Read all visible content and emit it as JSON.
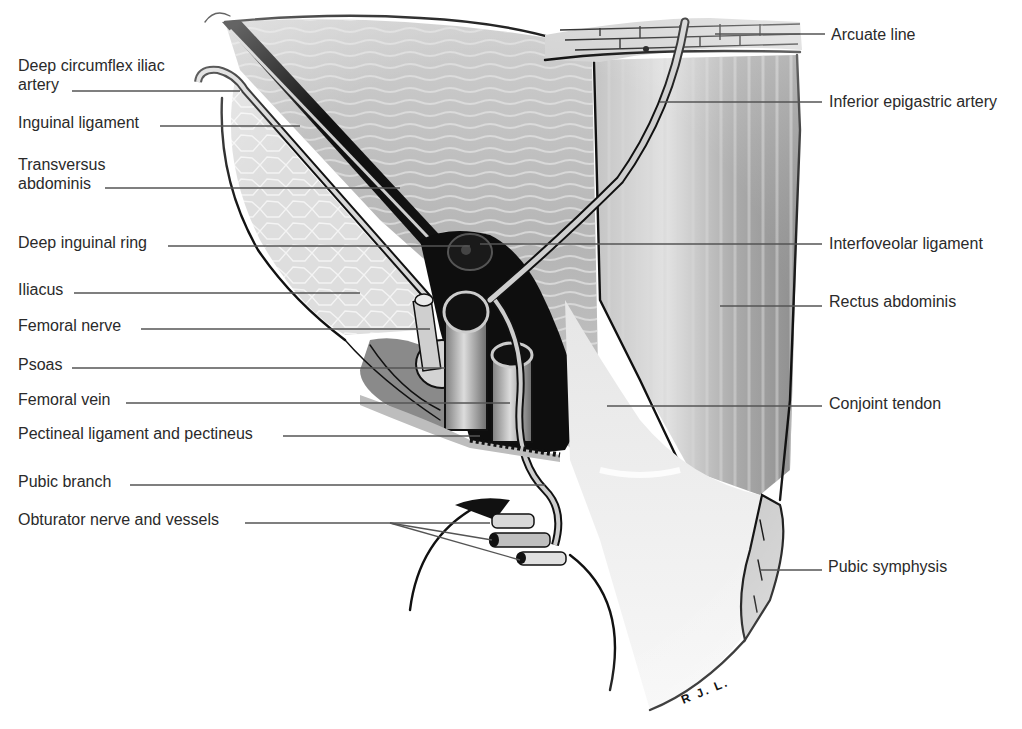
{
  "figure": {
    "signature": "R J. L.",
    "colors": {
      "background": "#ffffff",
      "muscle_light": "#d9d9d9",
      "muscle_mid": "#a8a8a8",
      "muscle_dark": "#7a7a7a",
      "outline": "#111111",
      "label_text": "#2a2a2a",
      "leader_line": "#555555"
    }
  },
  "labels_left": [
    {
      "id": "deep-circumflex-iliac-artery",
      "text": "Deep circumflex iliac\nartery",
      "line1": "Deep circumflex iliac",
      "line2": "artery"
    },
    {
      "id": "inguinal-ligament",
      "text": "Inguinal ligament"
    },
    {
      "id": "transversus-abdominis",
      "text": "Transversus\nabdominis",
      "line1": "Transversus",
      "line2": "abdominis"
    },
    {
      "id": "deep-inguinal-ring",
      "text": "Deep inguinal ring"
    },
    {
      "id": "iliacus",
      "text": "Iliacus"
    },
    {
      "id": "femoral-nerve",
      "text": "Femoral nerve"
    },
    {
      "id": "psoas",
      "text": "Psoas"
    },
    {
      "id": "femoral-vein",
      "text": "Femoral vein"
    },
    {
      "id": "pectineal-ligament",
      "text": "Pectineal ligament and pectineus"
    },
    {
      "id": "pubic-branch",
      "text": "Pubic branch"
    },
    {
      "id": "obturator-nerve-vessels",
      "text": "Obturator nerve and vessels"
    }
  ],
  "labels_right": [
    {
      "id": "arcuate-line",
      "text": "Arcuate line"
    },
    {
      "id": "inferior-epigastric-artery",
      "text": "Inferior epigastric artery"
    },
    {
      "id": "interfoveolar-ligament",
      "text": "Interfoveolar ligament"
    },
    {
      "id": "rectus-abdominis",
      "text": "Rectus abdominis"
    },
    {
      "id": "conjoint-tendon",
      "text": "Conjoint tendon"
    },
    {
      "id": "pubic-symphysis",
      "text": "Pubic symphysis"
    }
  ]
}
